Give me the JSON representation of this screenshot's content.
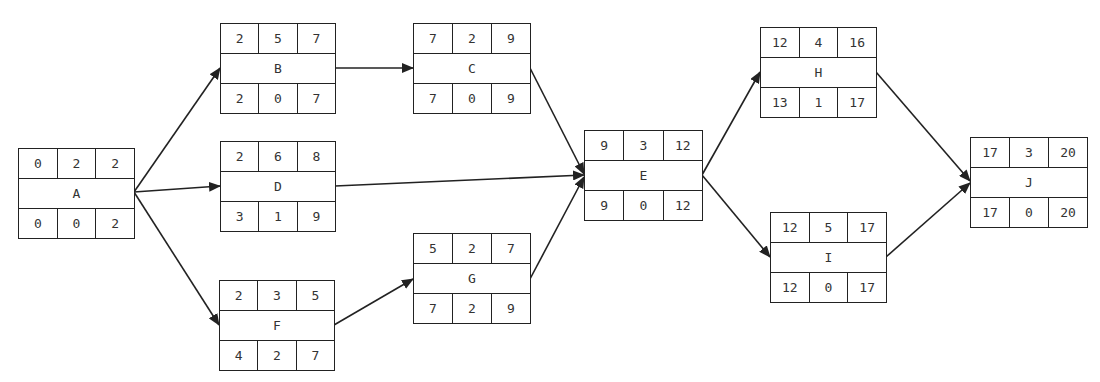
{
  "diagram": {
    "type": "activity-on-node network (critical path)",
    "nodes": {
      "A": {
        "label": "A",
        "top": [
          "0",
          "2",
          "2"
        ],
        "bottom": [
          "0",
          "0",
          "2"
        ]
      },
      "B": {
        "label": "B",
        "top": [
          "2",
          "5",
          "7"
        ],
        "bottom": [
          "2",
          "0",
          "7"
        ]
      },
      "C": {
        "label": "C",
        "top": [
          "7",
          "2",
          "9"
        ],
        "bottom": [
          "7",
          "0",
          "9"
        ]
      },
      "D": {
        "label": "D",
        "top": [
          "2",
          "6",
          "8"
        ],
        "bottom": [
          "3",
          "1",
          "9"
        ]
      },
      "E": {
        "label": "E",
        "top": [
          "9",
          "3",
          "12"
        ],
        "bottom": [
          "9",
          "0",
          "12"
        ]
      },
      "F": {
        "label": "F",
        "top": [
          "2",
          "3",
          "5"
        ],
        "bottom": [
          "4",
          "2",
          "7"
        ]
      },
      "G": {
        "label": "G",
        "top": [
          "5",
          "2",
          "7"
        ],
        "bottom": [
          "7",
          "2",
          "9"
        ]
      },
      "H": {
        "label": "H",
        "top": [
          "12",
          "4",
          "16"
        ],
        "bottom": [
          "13",
          "1",
          "17"
        ]
      },
      "I": {
        "label": "I",
        "top": [
          "12",
          "5",
          "17"
        ],
        "bottom": [
          "12",
          "0",
          "17"
        ]
      },
      "J": {
        "label": "J",
        "top": [
          "17",
          "3",
          "20"
        ],
        "bottom": [
          "17",
          "0",
          "20"
        ]
      }
    },
    "edges": [
      [
        "A",
        "B"
      ],
      [
        "A",
        "D"
      ],
      [
        "A",
        "F"
      ],
      [
        "B",
        "C"
      ],
      [
        "C",
        "E"
      ],
      [
        "D",
        "E"
      ],
      [
        "F",
        "G"
      ],
      [
        "G",
        "E"
      ],
      [
        "E",
        "H"
      ],
      [
        "E",
        "I"
      ],
      [
        "H",
        "J"
      ],
      [
        "I",
        "J"
      ]
    ],
    "colors": {
      "line": "#222222",
      "background": "#ffffff"
    }
  }
}
